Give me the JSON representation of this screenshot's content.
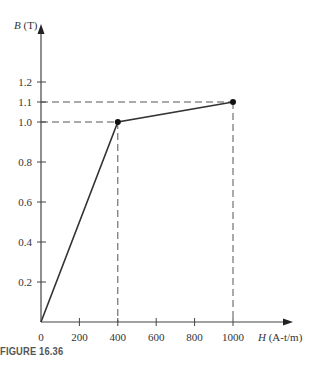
{
  "chart_data": {
    "type": "line",
    "title": "",
    "xlabel": "H (A-t/m)",
    "ylabel": "B (T)",
    "x": [
      0,
      400,
      1000
    ],
    "series": [
      {
        "name": "B-H curve",
        "values": [
          0,
          1.0,
          1.1
        ]
      }
    ],
    "marked_points": [
      {
        "x": 400,
        "y": 1.0
      },
      {
        "x": 1000,
        "y": 1.1
      }
    ],
    "x_ticks": [
      0,
      200,
      400,
      600,
      800,
      1000
    ],
    "x_tick_labels": [
      "0",
      "200",
      "400",
      "600",
      "800",
      "1000"
    ],
    "y_ticks": [
      0.2,
      0.4,
      0.6,
      0.8,
      1.0,
      1.1,
      1.2
    ],
    "y_tick_labels": [
      "0.2",
      "0.4",
      "0.6",
      "0.8",
      "1.0",
      "1.1",
      "1.2"
    ],
    "xlim": [
      0,
      1250
    ],
    "ylim": [
      0,
      1.48
    ],
    "grid": false,
    "guide_lines": "dashed lines from marked points to both axes",
    "legend": null
  },
  "labels": {
    "y_axis_var": "B",
    "y_axis_unit": " (T)",
    "x_axis_var": "H",
    "x_axis_unit": " (A-t/m)",
    "origin": "0"
  },
  "caption": "FIGURE 16.36"
}
